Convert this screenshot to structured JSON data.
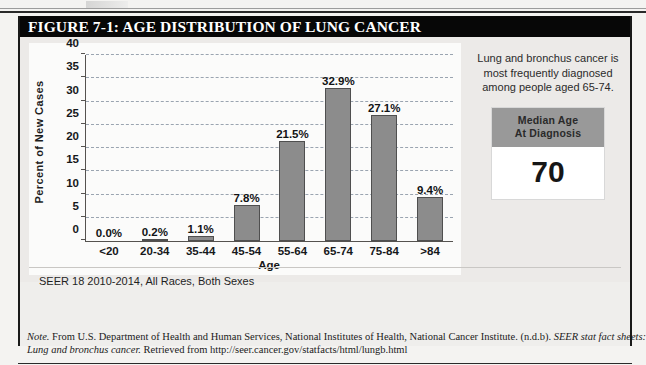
{
  "figure": {
    "title": "FIGURE 7-1: AGE DISTRIBUTION OF LUNG CANCER",
    "source_caption": "SEER 18 2010-2014, All Races, Both Sexes"
  },
  "side_panel": {
    "note_text": "Lung and bronchus cancer is most frequently diagnosed among people aged 65-74.",
    "median_box": {
      "header_line1": "Median Age",
      "header_line2": "At Diagnosis",
      "value": "70"
    }
  },
  "note": {
    "label": "Note.",
    "line1_a": " From U.S. Department of Health and Human Services, National Institutes of Health, National Cancer Institute. (n.d.b). ",
    "line1_b": "SEER stat fact sheets:",
    "line2_a": "Lung and bronchus cancer.",
    "line2_b": " Retrieved from http://seer.cancer.gov/statfacts/html/lungb.html"
  },
  "colors": {
    "bar_fill": "#8c8c8c",
    "bar_stroke": "#4f4f4f",
    "title_bar": "#070707",
    "gridline": "#9aa4b0",
    "median_header": "#999999"
  },
  "chart_data": {
    "type": "bar",
    "title": "",
    "xlabel": "Age",
    "ylabel": "Percent of New Cases",
    "categories": [
      "<20",
      "20-34",
      "35-44",
      "45-54",
      "55-64",
      "65-74",
      "75-84",
      ">84"
    ],
    "values": [
      0.0,
      0.2,
      1.1,
      7.8,
      21.5,
      32.9,
      27.1,
      9.4
    ],
    "data_labels": [
      "0.0%",
      "0.2%",
      "1.1%",
      "7.8%",
      "21.5%",
      "32.9%",
      "27.1%",
      "9.4%"
    ],
    "ylim": [
      0,
      40
    ],
    "yticks": [
      0,
      5,
      10,
      15,
      20,
      25,
      30,
      35,
      40
    ],
    "ytick_labels": [
      "0",
      "5",
      "10",
      "15",
      "20",
      "25",
      "30",
      "35",
      "40"
    ],
    "grid": true,
    "grid_style": "dashed-horizontal",
    "legend": "none"
  }
}
